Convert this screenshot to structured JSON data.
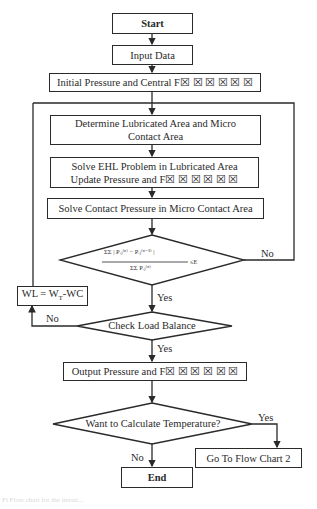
{
  "flowchart": {
    "nodes": {
      "start": {
        "label": "Start",
        "shape": "terminal"
      },
      "input": {
        "label": "Input Data",
        "shape": "process"
      },
      "initial": {
        "label": "Initial Pressure and Central F☒ ☒ ☒ ☒ ☒ ☒",
        "shape": "process"
      },
      "determine": {
        "label_line1": "Determine Lubricated Area and Micro",
        "label_line2": "Contact Area",
        "shape": "process"
      },
      "solve_ehl": {
        "label_line1": "Solve EHL Problem in Lubricated Area",
        "label_line2": "Update Pressure and F☒ ☒ ☒ ☒ ☒ ☒",
        "shape": "process"
      },
      "solve_contact": {
        "label": "Solve Contact Pressure in Micro Contact Area",
        "shape": "process"
      },
      "convergence": {
        "shape": "decision",
        "numerator": "ΣΣ | Pᵢⱼ⁽ⁿ⁾ − Pᵢⱼ⁽ⁿ⁻¹⁾ |",
        "denominator": "ΣΣ Pᵢⱼ⁽ⁿ⁾",
        "condition": "≤E"
      },
      "wl": {
        "label": "WL = W",
        "sub": "T",
        "suffix": "-WC",
        "shape": "process"
      },
      "load": {
        "label": "Check Load Balance",
        "shape": "decision"
      },
      "output": {
        "label": "Output Pressure and F☒ ☒ ☒ ☒ ☒ ☒",
        "shape": "process"
      },
      "temp": {
        "label": "Want to Calculate Temperature?",
        "shape": "decision"
      },
      "goto": {
        "label": "Go To Flow Chart 2",
        "shape": "process"
      },
      "end": {
        "label": "End",
        "shape": "terminal"
      }
    },
    "edge_labels": {
      "conv_no": "No",
      "conv_yes": "Yes",
      "load_no": "No",
      "load_yes": "Yes",
      "temp_yes": "Yes",
      "temp_no": "No"
    },
    "caption": "Fi  Flow chart for the iterati..."
  }
}
